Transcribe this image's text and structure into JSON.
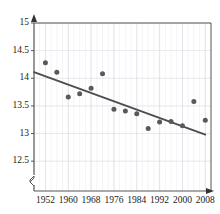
{
  "chart_data": {
    "type": "scatter",
    "title": "",
    "xlabel": "",
    "ylabel": "",
    "xlim": [
      1948,
      2010
    ],
    "ylim": [
      12.25,
      15
    ],
    "yticks": [
      "12.5",
      "13",
      "13.5",
      "14",
      "14.5",
      "15"
    ],
    "ytick_values": [
      12.5,
      13,
      13.5,
      14,
      14.5,
      15
    ],
    "xticks": [
      "1952",
      "1960",
      "1968",
      "1976",
      "1984",
      "1992",
      "2000",
      "2008"
    ],
    "xtick_values": [
      1952,
      1960,
      1968,
      1976,
      1984,
      1992,
      2000,
      2008
    ],
    "grid": true,
    "grid_color": "#d8d8e4",
    "axis_break": true,
    "axis_break_label": "",
    "legend": null,
    "marker_color": "#595959",
    "trend_color": "#4d4d4d",
    "series": [
      {
        "name": "observations",
        "marker": "circle",
        "x": [
          1952,
          1956,
          1960,
          1964,
          1968,
          1972,
          1976,
          1980,
          1984,
          1988,
          1992,
          1996,
          2000,
          2004,
          2008
        ],
        "y": [
          14.28,
          14.11,
          13.66,
          13.72,
          13.82,
          14.08,
          13.44,
          13.41,
          13.36,
          13.09,
          13.21,
          13.22,
          13.14,
          13.58,
          13.24
        ]
      },
      {
        "name": "trend-line",
        "marker": "line",
        "x": [
          1948,
          2008
        ],
        "y": [
          14.11,
          12.98
        ]
      }
    ]
  }
}
